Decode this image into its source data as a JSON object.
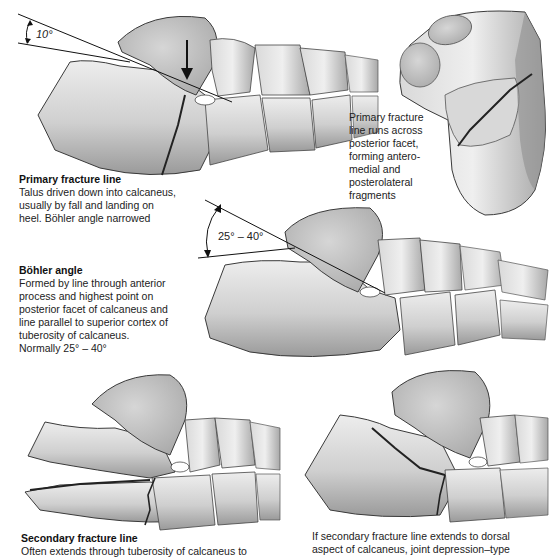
{
  "figure": {
    "colors": {
      "bone_light": "#e8e8e8",
      "bone_mid": "#c4c4c4",
      "bone_dark": "#8a8a8a",
      "outline": "#3a3a3a",
      "line": "#111111",
      "background": "#ffffff"
    }
  },
  "panels": {
    "primary_fracture": {
      "angle_label": "10°",
      "caption_title": "Primary fracture line",
      "caption_lines": [
        "Talus driven down into calcaneus,",
        "usually by fall and landing on",
        "heel. Böhler angle narrowed"
      ]
    },
    "superior_view": {
      "caption_lines": [
        "Primary fracture",
        "line runs across",
        "posterior facet,",
        "forming antero-",
        "medial and",
        "posterolateral",
        "fragments"
      ]
    },
    "bohler_angle": {
      "angle_label": "25° – 40°",
      "caption_title": "Böhler angle",
      "caption_lines": [
        "Formed by line through anterior",
        "process and highest point on",
        "posterior facet of calcaneus and",
        "line parallel to superior cortex of",
        "tuberosity of calcaneus.",
        "Normally 25° – 40°"
      ]
    },
    "secondary_fracture": {
      "caption_title": "Secondary fracture line",
      "caption_lines": [
        "Often extends through tuberosity of calcaneus to"
      ]
    },
    "joint_depression": {
      "caption_lines": [
        "If secondary fracture line extends to dorsal",
        "aspect of calcaneus, joint depression–type"
      ]
    }
  }
}
